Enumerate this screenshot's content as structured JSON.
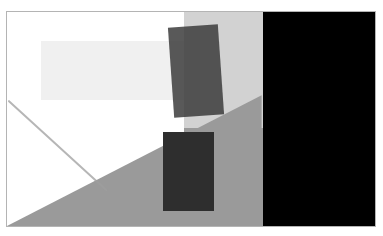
{
  "image": {
    "title": "Abstract Geometric Composition",
    "width": 383,
    "height": 236,
    "background_color": "#ffffff",
    "description": "Grayscale abstract composition of overlapping rectangles, a diagonal triangle wedge, a thin diagonal line and a solid black panel"
  },
  "frame": {
    "name": "plot-frame",
    "x": 6,
    "y": 11,
    "width": 370,
    "height": 216,
    "border_color": "#b4b4b4",
    "border_width": 1,
    "fill_color": "#ffffff"
  },
  "palette": {
    "white": "#ffffff",
    "very_light_gray": "#f0f0f0",
    "light_gray": "#d2d2d2",
    "medium_gray": "#9a9a9a",
    "dark_gray": "#5a5a5a",
    "darker_gray": "#3c3c3c",
    "near_black": "#272727",
    "black": "#000000",
    "line_gray": "#9e9e9e",
    "border_gray": "#b4b4b4"
  },
  "shapes": [
    {
      "id": "shape-1",
      "name": "light-gray-band-upper-left",
      "type": "rect",
      "x": 34,
      "y": 29,
      "width": 190,
      "height": 59,
      "color": "#f0f0f0",
      "opacity": 1,
      "rotation": 0
    },
    {
      "id": "shape-2",
      "name": "light-gray-vertical-band",
      "type": "rect",
      "x": 177,
      "y": 0,
      "width": 79,
      "height": 216,
      "color": "#d2d2d2",
      "opacity": 1,
      "rotation": 0
    },
    {
      "id": "shape-3",
      "name": "medium-gray-diagonal-wedge",
      "type": "polygon",
      "points": "0,216 256,84 256,216",
      "color": "#9a9a9a",
      "opacity": 1,
      "rotation": 0
    },
    {
      "id": "shape-4",
      "name": "medium-gray-lower-block",
      "type": "rect",
      "x": 177,
      "y": 116,
      "width": 79,
      "height": 100,
      "color": "#9a9a9a",
      "opacity": 1,
      "rotation": 0
    },
    {
      "id": "shape-5",
      "name": "rotated-dark-rectangle",
      "type": "rect",
      "x": 164,
      "y": 14,
      "width": 50,
      "height": 90,
      "color": "#3c3c3c",
      "opacity": 0.85,
      "rotation": -4
    },
    {
      "id": "shape-6",
      "name": "dark-rectangle-lower-center",
      "type": "rect",
      "x": 156,
      "y": 120,
      "width": 51,
      "height": 79,
      "color": "#2e2e2e",
      "opacity": 1,
      "rotation": 0
    },
    {
      "id": "shape-7",
      "name": "black-right-panel",
      "type": "rect",
      "x": 256,
      "y": 0,
      "width": 114,
      "height": 216,
      "color": "#000000",
      "opacity": 1,
      "rotation": 0
    }
  ],
  "lines": [
    {
      "id": "line-1",
      "name": "thin-diagonal-line",
      "x1": 2,
      "y1": 90,
      "x2": 100,
      "y2": 180,
      "color": "#9e9e9e",
      "width": 2,
      "opacity": 0.75
    }
  ]
}
